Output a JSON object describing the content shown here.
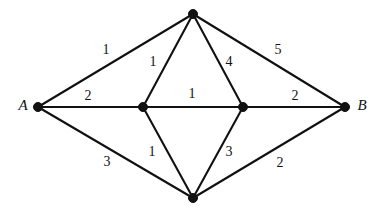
{
  "figure": {
    "type": "weighted-undirected-graph",
    "width": 382,
    "height": 213,
    "background_color": "#ffffff",
    "stroke_color": "#111111",
    "text_color": "#111111"
  },
  "vertices": [
    {
      "id": "A",
      "label": "A",
      "label_visible": true,
      "x": 38,
      "y": 107,
      "label_x": 23,
      "label_y": 105,
      "radius": 4.5
    },
    {
      "id": "T",
      "label": "",
      "label_visible": false,
      "x": 193,
      "y": 14,
      "label_x": 193,
      "label_y": 14,
      "radius": 4.5
    },
    {
      "id": "L",
      "label": "",
      "label_visible": false,
      "x": 143,
      "y": 107,
      "label_x": 143,
      "label_y": 107,
      "radius": 4.5
    },
    {
      "id": "R",
      "label": "",
      "label_visible": false,
      "x": 243,
      "y": 107,
      "label_x": 243,
      "label_y": 107,
      "radius": 4.5
    },
    {
      "id": "D",
      "label": "",
      "label_visible": false,
      "x": 193,
      "y": 198,
      "label_x": 193,
      "label_y": 198,
      "radius": 4.5
    },
    {
      "id": "B",
      "label": "B",
      "label_visible": true,
      "x": 345,
      "y": 107,
      "label_x": 362,
      "label_y": 105,
      "radius": 4.5
    }
  ],
  "edges": [
    {
      "id": "A-T",
      "from": "A",
      "to": "T",
      "weight": "1",
      "label_x": 106,
      "label_y": 50
    },
    {
      "id": "A-L",
      "from": "A",
      "to": "L",
      "weight": "2",
      "label_x": 88,
      "label_y": 96
    },
    {
      "id": "A-D",
      "from": "A",
      "to": "D",
      "weight": "3",
      "label_x": 107,
      "label_y": 162
    },
    {
      "id": "T-L",
      "from": "T",
      "to": "L",
      "weight": "1",
      "label_x": 153,
      "label_y": 62
    },
    {
      "id": "T-R",
      "from": "T",
      "to": "R",
      "weight": "4",
      "label_x": 229,
      "label_y": 62
    },
    {
      "id": "T-B",
      "from": "T",
      "to": "B",
      "weight": "5",
      "label_x": 278,
      "label_y": 50
    },
    {
      "id": "L-R",
      "from": "L",
      "to": "R",
      "weight": "1",
      "label_x": 192,
      "label_y": 94
    },
    {
      "id": "L-D",
      "from": "L",
      "to": "D",
      "weight": "1",
      "label_x": 152,
      "label_y": 152
    },
    {
      "id": "R-D",
      "from": "R",
      "to": "D",
      "weight": "3",
      "label_x": 229,
      "label_y": 152
    },
    {
      "id": "R-B",
      "from": "R",
      "to": "B",
      "weight": "2",
      "label_x": 295,
      "label_y": 96
    },
    {
      "id": "D-B",
      "from": "D",
      "to": "B",
      "weight": "2",
      "label_x": 280,
      "label_y": 163
    }
  ]
}
